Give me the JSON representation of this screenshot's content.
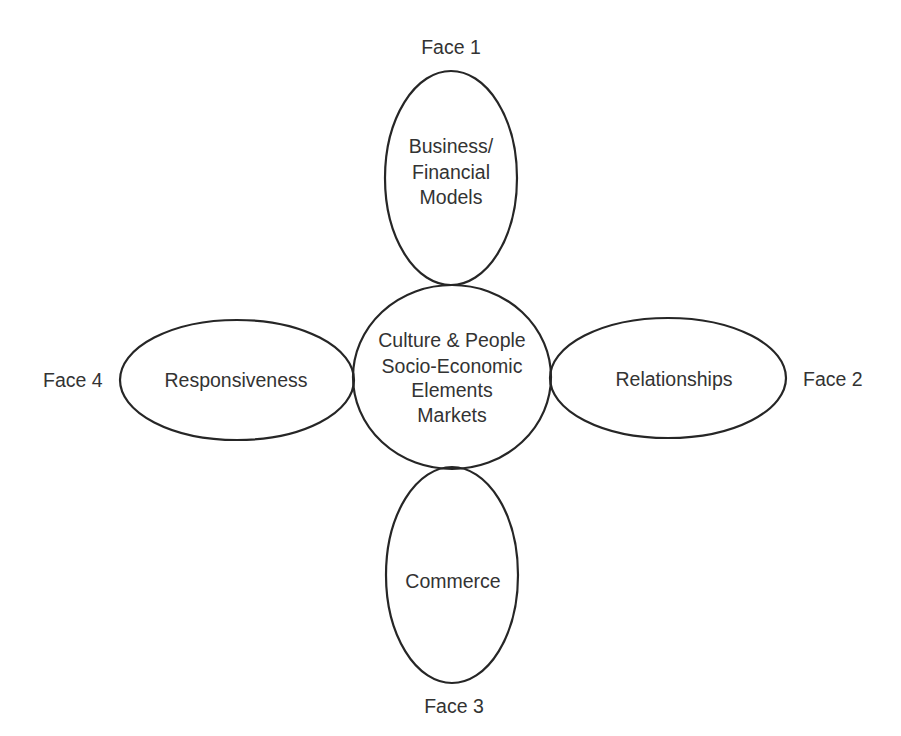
{
  "diagram": {
    "center": {
      "lines": [
        "Culture & People",
        "Socio-Economic",
        "Elements",
        "Markets"
      ]
    },
    "petals": [
      {
        "id": "top",
        "face_label": "Face 1",
        "lines": [
          "Business/",
          "Financial",
          "Models"
        ]
      },
      {
        "id": "right",
        "face_label": "Face 2",
        "lines": [
          "Relationships"
        ]
      },
      {
        "id": "bottom",
        "face_label": "Face 3",
        "lines": [
          "Commerce"
        ]
      },
      {
        "id": "left",
        "face_label": "Face 4",
        "lines": [
          "Responsiveness"
        ]
      }
    ],
    "colors": {
      "stroke": "#262626",
      "text": "#333333",
      "background": "#ffffff"
    }
  }
}
